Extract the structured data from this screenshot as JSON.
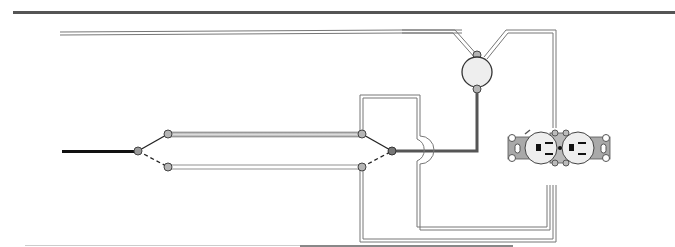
{
  "diagram": {
    "title": "",
    "colors": {
      "background": "#ffffff",
      "border_rule": "#555555",
      "feed_wire": "#111111",
      "hot_wire": "#555555",
      "cable_outline": "#777777",
      "cable_fill": "#ffffff",
      "terminal_fill": "#b5b5b5",
      "fixture_fill": "#eeeeee",
      "receptacle_strap": "#a9a9a9",
      "receptacle_face": "#eeeeee"
    },
    "components": [
      {
        "id": "power-feed",
        "label": "Incoming power feed"
      },
      {
        "id": "three-way-switch-1",
        "label": "Three-way switch 1"
      },
      {
        "id": "three-way-switch-2",
        "label": "Three-way switch 2"
      },
      {
        "id": "light-fixture",
        "label": "Light fixture"
      },
      {
        "id": "duplex-receptacle",
        "label": "Duplex receptacle"
      }
    ]
  }
}
